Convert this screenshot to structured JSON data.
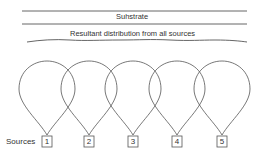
{
  "diagram": {
    "substrate_label": "Suhstrate",
    "distribution_label": "Resultant distribution from all sources",
    "sources_label": "Sources",
    "sources": [
      {
        "id": "1",
        "cx": 47
      },
      {
        "id": "2",
        "cx": 89
      },
      {
        "id": "3",
        "cx": 133
      },
      {
        "id": "4",
        "cx": 177
      },
      {
        "id": "5",
        "cx": 222
      }
    ],
    "colors": {
      "line": "#555555",
      "text": "#333333"
    }
  }
}
